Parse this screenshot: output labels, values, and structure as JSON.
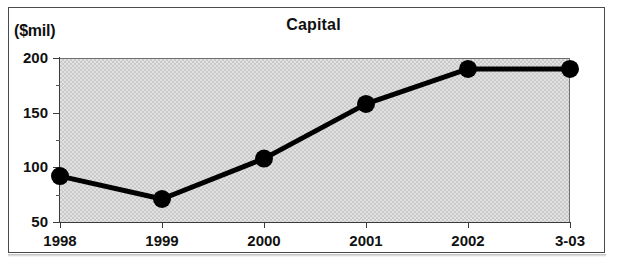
{
  "chart_data": {
    "type": "line",
    "title": "Capital",
    "ylabel": "($mil)",
    "xlabel": "",
    "categories": [
      "1998",
      "1999",
      "2000",
      "2001",
      "2002",
      "3-03"
    ],
    "values": [
      92,
      71,
      108,
      158,
      190,
      190
    ],
    "series": [
      {
        "name": "Capital",
        "values": [
          92,
          71,
          108,
          158,
          190,
          190
        ]
      }
    ],
    "ylim": [
      50,
      200
    ],
    "y_ticks": [
      "50",
      "100",
      "150",
      "200"
    ],
    "y_tick_values": [
      50,
      100,
      150,
      200
    ],
    "y_minor_tick_values": [
      75,
      125,
      175
    ],
    "grid": false,
    "legend": false,
    "marker": "filled-circle",
    "line_color": "#000000",
    "marker_color": "#000000",
    "plot_background": "#e2e2e2"
  },
  "figure": {
    "unit_label": "($mil)",
    "title": "Capital"
  }
}
